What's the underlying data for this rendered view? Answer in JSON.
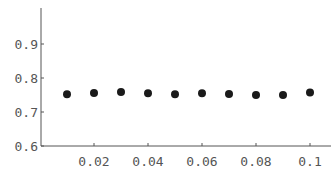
{
  "chart_data": {
    "type": "scatter",
    "title": "",
    "xlabel": "",
    "ylabel": "",
    "x": [
      0.01,
      0.02,
      0.03,
      0.04,
      0.05,
      0.06,
      0.07,
      0.08,
      0.09,
      0.1
    ],
    "y": [
      0.752,
      0.756,
      0.759,
      0.755,
      0.752,
      0.755,
      0.753,
      0.75,
      0.75,
      0.757
    ],
    "xlim": [
      0,
      0.1
    ],
    "ylim": [
      0.6,
      1.0
    ],
    "xticks": [
      0.02,
      0.04,
      0.06,
      0.08,
      0.1
    ],
    "xtick_labels": [
      "0.02",
      "0.04",
      "0.06",
      "0.08",
      "0.1"
    ],
    "yticks": [
      0.6,
      0.7,
      0.8,
      0.9
    ],
    "ytick_labels": [
      "0.6",
      "0.7",
      "0.8",
      "0.9"
    ],
    "grid": false,
    "legend": null,
    "marker_color": "#1a1a1a",
    "axis_color": "#555555"
  }
}
